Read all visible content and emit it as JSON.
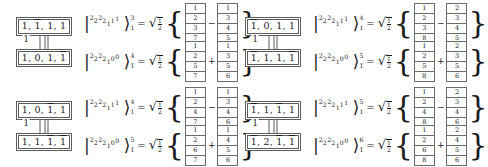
{
  "page": {
    "equals": "=",
    "coefficient": {
      "radical": "√",
      "numerator": "1",
      "denominator": "2"
    },
    "brace_open": "{",
    "brace_close": "}",
    "ket_bar": "|",
    "ket_angle": "⟩"
  },
  "groups": [
    {
      "id": "top-left",
      "nodes": [
        {
          "label": "1, 1̅, 1, 1",
          "parts": [
            "1",
            ",",
            "1",
            ",",
            "1",
            ",",
            "1"
          ],
          "bars": [
            false,
            false,
            true,
            false,
            false,
            false,
            false
          ]
        },
        {
          "label": "1, 0, 1, 1̅",
          "parts": [
            "1",
            ",",
            "0",
            ",",
            "1",
            ",",
            "1"
          ],
          "bars": [
            false,
            false,
            false,
            false,
            false,
            false,
            true
          ]
        }
      ],
      "edge_label": "1",
      "equations": [
        {
          "ket": {
            "digits": [
              "2",
              "2",
              "2",
              "2",
              "1",
              "1",
              "1"
            ],
            "superscript": "3",
            "subscript": "1"
          },
          "coefficient": "√1/2",
          "tableaux": [
            {
              "cells": [
                "1",
                "2",
                "3",
                "7"
              ]
            },
            {
              "cells": [
                "1",
                "3",
                "4",
                "5"
              ]
            }
          ],
          "operator": "−"
        },
        {
          "ket": {
            "digits": [
              "2",
              "2",
              "2",
              "2",
              "1",
              "0",
              "0"
            ],
            "superscript": "4",
            "subscript": "1̅"
          },
          "coefficient": "√1/2",
          "tableaux": [
            {
              "cells": [
                "1",
                "2",
                "5",
                "7"
              ]
            },
            {
              "cells": [
                "1",
                "3",
                "5",
                "6"
              ]
            }
          ],
          "operator": "+"
        }
      ]
    },
    {
      "id": "top-right",
      "nodes": [
        {
          "label": "1̅, 0, 1, 1",
          "parts": [
            "1",
            ",",
            "0",
            ",",
            "1",
            ",",
            "1"
          ],
          "bars": [
            true,
            false,
            false,
            false,
            false,
            false,
            false
          ]
        },
        {
          "label": "1̅, 1, 1, 1̅",
          "parts": [
            "1",
            ",",
            "1",
            ",",
            "1",
            ",",
            "1"
          ],
          "bars": [
            true,
            false,
            false,
            false,
            false,
            false,
            true
          ]
        }
      ],
      "edge_label": "1",
      "equations": [
        {
          "ket": {
            "digits": [
              "2",
              "2",
              "2",
              "2",
              "1",
              "1",
              "1"
            ],
            "superscript": "4",
            "subscript": "1"
          },
          "coefficient": "√1/2",
          "tableaux": [
            {
              "cells": [
                "1",
                "2",
                "3",
                "8"
              ]
            },
            {
              "cells": [
                "2",
                "3",
                "4",
                "5"
              ]
            }
          ],
          "operator": "−"
        },
        {
          "ket": {
            "digits": [
              "2",
              "2",
              "2",
              "2",
              "1",
              "0",
              "0"
            ],
            "superscript": "5",
            "subscript": "1̅"
          },
          "coefficient": "√1/2",
          "tableaux": [
            {
              "cells": [
                "1",
                "2",
                "5",
                "8"
              ]
            },
            {
              "cells": [
                "2",
                "3",
                "5",
                "6"
              ]
            }
          ],
          "operator": "+"
        }
      ]
    },
    {
      "id": "bottom-left",
      "nodes": [
        {
          "label": "1, 0, 1̅, 1",
          "parts": [
            "1",
            ",",
            "0",
            ",",
            "1",
            ",",
            "1"
          ],
          "bars": [
            false,
            false,
            false,
            false,
            true,
            false,
            false
          ]
        },
        {
          "label": "1, 1, 1̅, 1̅",
          "parts": [
            "1",
            ",",
            "1",
            ",",
            "1",
            ",",
            "1"
          ],
          "bars": [
            false,
            false,
            false,
            false,
            true,
            false,
            true
          ]
        }
      ],
      "edge_label": "1",
      "equations": [
        {
          "ket": {
            "digits": [
              "2",
              "2",
              "2",
              "2",
              "1",
              "1",
              "1"
            ],
            "superscript": "4",
            "subscript": "1"
          },
          "coefficient": "√1/2",
          "tableaux": [
            {
              "cells": [
                "1",
                "2",
                "4",
                "7"
              ]
            },
            {
              "cells": [
                "1",
                "3",
                "4",
                "6"
              ]
            }
          ],
          "operator": "−"
        },
        {
          "ket": {
            "digits": [
              "2",
              "2",
              "2",
              "2",
              "1",
              "0",
              "0"
            ],
            "superscript": "5",
            "subscript": "1̅"
          },
          "coefficient": "√1/2",
          "tableaux": [
            {
              "cells": [
                "1",
                "2",
                "6",
                "7"
              ]
            },
            {
              "cells": [
                "1",
                "4",
                "5",
                "6"
              ]
            }
          ],
          "operator": "+"
        }
      ]
    },
    {
      "id": "bottom-right",
      "nodes": [
        {
          "label": "1̅, 1, 1̅, 1",
          "parts": [
            "1",
            ",",
            "1",
            ",",
            "1",
            ",",
            "1"
          ],
          "bars": [
            true,
            false,
            false,
            false,
            true,
            false,
            false
          ]
        },
        {
          "label": "1̅, 2, 1̅, 1̅",
          "parts": [
            "1",
            ",",
            "2",
            ",",
            "1",
            ",",
            "1"
          ],
          "bars": [
            true,
            false,
            false,
            false,
            true,
            false,
            true
          ]
        }
      ],
      "edge_label": "1",
      "equations": [
        {
          "ket": {
            "digits": [
              "2",
              "2",
              "2",
              "2",
              "1",
              "1",
              "1"
            ],
            "superscript": "5",
            "subscript": "1"
          },
          "coefficient": "√1/2",
          "tableaux": [
            {
              "cells": [
                "1",
                "2",
                "4",
                "8"
              ]
            },
            {
              "cells": [
                "2",
                "3",
                "4",
                "6"
              ]
            }
          ],
          "operator": "−"
        },
        {
          "ket": {
            "digits": [
              "2",
              "2",
              "2",
              "2",
              "1",
              "0",
              "0"
            ],
            "superscript": "6",
            "subscript": "1̅"
          },
          "coefficient": "√1/2",
          "tableaux": [
            {
              "cells": [
                "1",
                "2",
                "6",
                "8"
              ]
            },
            {
              "cells": [
                "2",
                "4",
                "5",
                "6"
              ]
            }
          ],
          "operator": "+"
        }
      ]
    }
  ]
}
